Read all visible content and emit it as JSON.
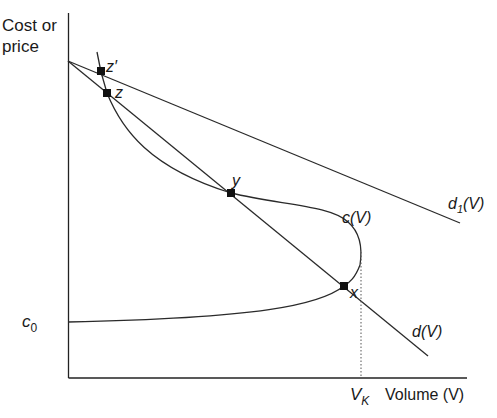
{
  "diagram": {
    "y_axis_label_line1": "Cost or",
    "y_axis_label_line2": "price",
    "x_axis_label": "Volume (V)",
    "x_tick_label_main": "V",
    "x_tick_label_sub": "K",
    "y_tick_label_main": "c",
    "y_tick_label_sub": "0",
    "curves": {
      "cost_curve_label": "c(V)",
      "demand_curve_label": "d(V)",
      "demand_curve_1_label_main": "d",
      "demand_curve_1_label_sub": "1",
      "demand_curve_1_label_tail": "(V)"
    },
    "points": {
      "z_prime": "z′",
      "z": "z",
      "y": "y",
      "x": "x"
    },
    "colors": {
      "line": "#2a2a2a",
      "background": "#ffffff"
    }
  }
}
